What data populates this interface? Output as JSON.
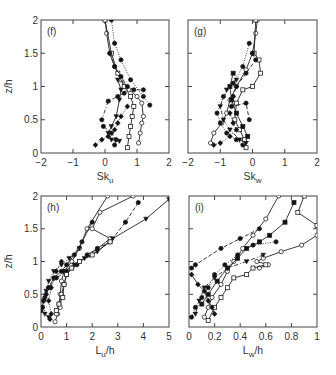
{
  "figure": {
    "ylabel": "z/h"
  },
  "chart_data": [
    {
      "type": "line",
      "panel": "(f)",
      "xlabel": "Sk",
      "xlabel_sub": "u",
      "ylabel": "z/h",
      "xlim": [
        -2,
        2
      ],
      "ylim": [
        0,
        2
      ],
      "xticks": [
        -2,
        -1,
        0,
        1,
        2
      ],
      "xtick_labels": [
        "−2",
        "−1",
        "0",
        "1",
        "2"
      ],
      "yticks": [
        0,
        0.5,
        1,
        1.5,
        2
      ],
      "ytick_labels": [
        "0",
        "0.5",
        "1",
        "1.5",
        "2"
      ],
      "series": [
        {
          "name": "s1",
          "marker": "open-circle",
          "line": "solid",
          "x": [
            0.0,
            0.05,
            0.15,
            0.3,
            0.5,
            0.75,
            1.0,
            1.15,
            1.2,
            1.15,
            1.1,
            1.05
          ],
          "y": [
            2.0,
            1.8,
            1.5,
            1.3,
            1.1,
            0.95,
            0.85,
            0.75,
            0.55,
            0.45,
            0.3,
            0.15
          ]
        },
        {
          "name": "s2",
          "marker": "open-square",
          "line": "solid",
          "x": [
            0.0,
            0.2,
            0.4,
            0.6,
            0.8,
            0.9,
            0.85,
            0.8,
            0.75,
            0.7
          ],
          "y": [
            2.0,
            1.5,
            1.2,
            1.0,
            0.85,
            0.7,
            0.55,
            0.4,
            0.25,
            0.08
          ]
        },
        {
          "name": "s3",
          "marker": "filled-circle",
          "line": "dashed",
          "x": [
            0.15,
            0.3,
            0.5,
            0.7,
            0.9,
            1.2
          ],
          "y": [
            1.5,
            1.3,
            1.15,
            1.0,
            0.95,
            0.95
          ]
        },
        {
          "name": "s4",
          "marker": "filled-circle",
          "line": "dotted",
          "x": [
            0.2,
            0.3,
            0.5,
            0.8,
            1.2,
            1.4
          ],
          "y": [
            2.0,
            1.65,
            1.4,
            1.1,
            0.85,
            0.72
          ]
        },
        {
          "name": "s5",
          "marker": "filled-circle",
          "line": "dash-dot",
          "x": [
            0.6,
            0.4,
            0.1,
            -0.1,
            -0.05,
            0.2,
            0.35,
            0.3
          ],
          "y": [
            0.9,
            0.85,
            0.78,
            0.5,
            0.4,
            0.3,
            0.2,
            0.12
          ]
        },
        {
          "name": "s6",
          "marker": "filled-diamond",
          "line": "dotted",
          "x": [
            0.7,
            0.5,
            0.4,
            0.3,
            0.1,
            -0.1,
            -0.3
          ],
          "y": [
            0.7,
            0.55,
            0.45,
            0.35,
            0.25,
            0.2,
            0.12
          ]
        },
        {
          "name": "s7",
          "marker": "filled-triangle",
          "line": "solid",
          "x": [
            0.4,
            0.5,
            0.45,
            0.35,
            0.2,
            0.1,
            0.2,
            0.45
          ],
          "y": [
            1.1,
            0.95,
            0.8,
            0.55,
            0.4,
            0.3,
            0.2,
            0.18
          ]
        }
      ]
    },
    {
      "type": "line",
      "panel": "(g)",
      "xlabel": "Sk",
      "xlabel_sub": "w",
      "ylabel": "",
      "xlim": [
        -2,
        2
      ],
      "ylim": [
        0,
        2
      ],
      "xticks": [
        -2,
        -1,
        0,
        1,
        2
      ],
      "xtick_labels": [
        "−2",
        "−1",
        "0",
        "1",
        "2"
      ],
      "yticks": [
        0,
        0.5,
        1,
        1.5,
        2
      ],
      "series": [
        {
          "name": "s1",
          "marker": "open-circle",
          "line": "solid",
          "x": [
            0.15,
            0.1,
            0.0,
            -0.2,
            -0.5,
            -0.7,
            -0.8,
            -0.95,
            -1.2,
            -1.3
          ],
          "y": [
            2.0,
            1.8,
            1.5,
            1.25,
            1.0,
            0.8,
            0.6,
            0.45,
            0.3,
            0.15
          ]
        },
        {
          "name": "s2",
          "marker": "open-square",
          "line": "solid",
          "x": [
            0.1,
            0.05,
            0.2,
            0.25,
            0.0,
            -0.3,
            -0.5,
            -0.55,
            -0.4,
            -0.25,
            -0.2
          ],
          "y": [
            2.0,
            1.5,
            1.4,
            1.2,
            1.0,
            0.95,
            0.75,
            0.5,
            0.35,
            0.2,
            0.08
          ]
        },
        {
          "name": "s3",
          "marker": "filled-circle",
          "line": "dashed",
          "x": [
            0.0,
            0.1,
            -0.2,
            -0.5,
            -0.6,
            -0.65,
            -0.2,
            -0.1
          ],
          "y": [
            1.5,
            1.4,
            1.2,
            1.0,
            0.85,
            0.7,
            0.75,
            0.5
          ]
        },
        {
          "name": "s4",
          "marker": "filled-circle",
          "line": "dotted",
          "x": [
            -0.1,
            -0.3,
            -0.6,
            -0.9,
            -1.1,
            -1.0,
            -0.8,
            -0.5,
            -0.3
          ],
          "y": [
            1.65,
            1.3,
            1.05,
            0.85,
            0.6,
            0.45,
            0.3,
            0.2,
            0.12
          ]
        },
        {
          "name": "s5",
          "marker": "filled-triangle",
          "line": "dash-dot",
          "x": [
            -0.5,
            -0.8,
            -1.0,
            -0.9,
            -0.7,
            -0.4,
            -0.2
          ],
          "y": [
            1.1,
            0.95,
            0.7,
            0.5,
            0.35,
            0.2,
            0.15
          ]
        },
        {
          "name": "s6",
          "marker": "filled-diamond",
          "line": "dotted",
          "x": [
            -0.7,
            -0.6,
            -0.5,
            -0.7,
            -1.0,
            -1.2
          ],
          "y": [
            0.6,
            0.45,
            0.35,
            0.25,
            0.15,
            0.12
          ]
        },
        {
          "name": "s7",
          "marker": "filled-square",
          "line": "solid",
          "x": [
            -0.6,
            -0.7,
            -0.65,
            -0.5,
            -0.3,
            -0.15
          ],
          "y": [
            1.2,
            1.0,
            0.8,
            0.6,
            0.4,
            0.25
          ]
        }
      ]
    },
    {
      "type": "line",
      "panel": "(h)",
      "xlabel": "L",
      "xlabel_sub": "u",
      "xlabel_suffix": "/h",
      "ylabel": "z/h",
      "xlim": [
        0,
        5
      ],
      "ylim": [
        0,
        2
      ],
      "xticks": [
        0,
        1,
        2,
        3,
        4,
        5
      ],
      "xtick_labels": [
        "0",
        "1",
        "2",
        "3",
        "4",
        "5"
      ],
      "yticks": [
        0,
        0.5,
        1,
        1.5,
        2
      ],
      "ytick_labels": [
        "0",
        "0.5",
        "1",
        "1.5",
        "2"
      ],
      "series": [
        {
          "name": "s1",
          "marker": "open-circle",
          "line": "solid",
          "x": [
            2.6,
            1.8,
            1.5,
            1.2,
            0.9,
            0.8,
            0.75,
            0.7,
            0.65,
            0.55
          ],
          "y": [
            2.0,
            1.5,
            1.2,
            1.0,
            0.85,
            0.7,
            0.5,
            0.35,
            0.2,
            0.08
          ]
        },
        {
          "name": "s2",
          "marker": "open-circle",
          "line": "solid",
          "x": [
            3.6,
            2.3,
            2.0,
            2.7,
            1.9,
            1.5,
            1.2,
            1.0,
            0.9,
            0.8,
            0.75,
            0.6
          ],
          "y": [
            2.0,
            1.75,
            1.5,
            1.35,
            1.1,
            1.0,
            0.9,
            0.8,
            0.65,
            0.5,
            0.3,
            0.2
          ]
        },
        {
          "name": "s3",
          "marker": "filled-circle",
          "line": "dashed",
          "x": [
            3.8,
            3.3,
            2.7,
            2.2,
            1.8,
            1.4,
            1.0,
            0.6,
            0.3,
            0.15,
            0.05
          ],
          "y": [
            1.9,
            1.6,
            1.3,
            1.2,
            1.1,
            0.95,
            0.85,
            0.75,
            0.6,
            0.45,
            0.3
          ]
        },
        {
          "name": "s4",
          "marker": "filled-triangle",
          "line": "solid",
          "x": [
            5.0,
            4.1,
            2.8,
            2.2,
            1.7,
            1.3,
            0.9
          ],
          "y": [
            1.95,
            1.65,
            1.35,
            1.15,
            1.05,
            0.95,
            0.85
          ]
        },
        {
          "name": "s5",
          "marker": "filled-circle",
          "line": "solid",
          "x": [
            2.0,
            1.6,
            1.3,
            1.0,
            0.8,
            0.5,
            0.3,
            0.2,
            0.1,
            0.05,
            0.0
          ],
          "y": [
            1.6,
            1.3,
            1.1,
            0.95,
            0.85,
            0.75,
            0.6,
            0.5,
            0.4,
            0.3,
            0.25
          ]
        },
        {
          "name": "s6",
          "marker": "filled-triangle",
          "line": "dotted",
          "x": [
            1.5,
            1.1,
            0.8,
            0.5,
            0.3,
            0.2,
            0.1,
            0.15,
            0.3
          ],
          "y": [
            1.2,
            1.05,
            0.95,
            0.85,
            0.7,
            0.55,
            0.4,
            0.2,
            0.15
          ]
        },
        {
          "name": "s7",
          "marker": "open-square",
          "line": "solid",
          "x": [
            2.7,
            2.0,
            1.5,
            1.2,
            1.0,
            0.9,
            0.85,
            0.7,
            0.6
          ],
          "y": [
            1.3,
            1.1,
            1.0,
            0.9,
            0.8,
            0.65,
            0.45,
            0.35,
            0.25
          ]
        },
        {
          "name": "s8",
          "marker": "filled-diamond",
          "line": "dotted",
          "x": [
            0.8,
            0.6,
            0.4,
            0.3,
            0.4,
            0.35
          ],
          "y": [
            1.0,
            0.85,
            0.6,
            0.4,
            0.2,
            0.12
          ]
        }
      ]
    },
    {
      "type": "line",
      "panel": "(i)",
      "xlabel": "L",
      "xlabel_sub": "w",
      "xlabel_suffix": "/h",
      "ylabel": "",
      "xlim": [
        0,
        1
      ],
      "ylim": [
        0,
        2
      ],
      "xticks": [
        0,
        0.2,
        0.4,
        0.6,
        0.8,
        1
      ],
      "xtick_labels": [
        "0",
        "0.2",
        "0.4",
        "0.6",
        "0.8",
        "1"
      ],
      "yticks": [
        0,
        0.5,
        1,
        1.5,
        2
      ],
      "series": [
        {
          "name": "s1",
          "marker": "open-circle",
          "line": "solid",
          "x": [
            0.7,
            0.6,
            0.5,
            0.42,
            0.35,
            0.3,
            0.25,
            0.18,
            0.15,
            0.12
          ],
          "y": [
            2.0,
            1.65,
            1.4,
            1.2,
            1.0,
            0.85,
            0.65,
            0.45,
            0.3,
            0.15
          ]
        },
        {
          "name": "s2",
          "marker": "open-square",
          "line": "solid",
          "x": [
            0.9,
            0.85,
            1.0
          ],
          "y": [
            2.0,
            1.75,
            1.55
          ]
        },
        {
          "name": "s3",
          "marker": "open-circle",
          "line": "solid",
          "x": [
            1.0,
            0.88,
            0.72,
            0.58,
            0.53,
            0.62,
            0.55
          ],
          "y": [
            1.4,
            1.25,
            1.15,
            1.05,
            1.0,
            0.95,
            0.9
          ]
        },
        {
          "name": "s4",
          "marker": "open-square",
          "line": "solid",
          "x": [
            0.6,
            0.5,
            0.45,
            0.35,
            0.3,
            0.25,
            0.2,
            0.15
          ],
          "y": [
            0.95,
            0.9,
            0.8,
            0.75,
            0.6,
            0.45,
            0.3,
            0.1
          ]
        },
        {
          "name": "s5",
          "marker": "filled-square",
          "line": "solid",
          "x": [
            0.82,
            0.75,
            0.63,
            0.55,
            0.45,
            0.38,
            0.3,
            0.22,
            0.15,
            0.1
          ],
          "y": [
            1.9,
            1.6,
            1.4,
            1.3,
            1.2,
            1.05,
            0.9,
            0.7,
            0.5,
            0.35
          ]
        },
        {
          "name": "s6",
          "marker": "filled-circle",
          "line": "dashed",
          "x": [
            0.55,
            0.4,
            0.25,
            0.05,
            0.02
          ],
          "y": [
            1.5,
            1.35,
            1.2,
            0.95,
            0.9
          ]
        },
        {
          "name": "s7",
          "marker": "filled-circle",
          "line": "dotted",
          "x": [
            0.68,
            0.5,
            0.38,
            0.28,
            0.2,
            0.15,
            0.1,
            0.05,
            0.02
          ],
          "y": [
            1.3,
            1.25,
            1.1,
            0.95,
            0.8,
            0.6,
            0.45,
            0.3,
            0.15
          ]
        },
        {
          "name": "s8",
          "marker": "filled-triangle",
          "line": "dash-dot",
          "x": [
            0.58,
            0.45,
            0.3,
            0.2,
            0.12,
            0.08,
            0.05
          ],
          "y": [
            1.1,
            1.0,
            0.9,
            0.75,
            0.6,
            0.4,
            0.2
          ]
        },
        {
          "name": "s9",
          "marker": "filled-diamond",
          "line": "solid",
          "x": [
            0.02,
            0.07,
            0.12,
            0.15,
            0.18,
            0.2
          ],
          "y": [
            0.8,
            0.65,
            0.55,
            0.4,
            0.3,
            0.2
          ]
        }
      ]
    }
  ]
}
